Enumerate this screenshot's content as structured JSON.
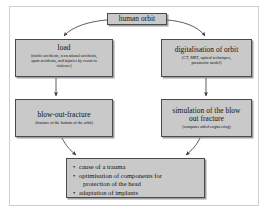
{
  "figure": {
    "type": "flowchart",
    "orientation": "top-down",
    "box_fill": "#c9c9c9",
    "box_border": "#4a4a4a",
    "arrow_color": "#333333",
    "frame_color": "#cfcfcf"
  },
  "nodes": {
    "root": {
      "id": "human-orbit",
      "title": "human orbit",
      "subtitle": ""
    },
    "load": {
      "id": "load",
      "title": "load",
      "subtitle_line1": "(traffic accidents, recreational accidents,",
      "subtitle_line2": "sport accidents, and injuries by resort to",
      "subtitle_line3": "violence)"
    },
    "digitalisation": {
      "id": "digitalisation-of-orbit",
      "title": "digitalisation of orbit",
      "subtitle_line1": "(CT, MRT, optical techniques,",
      "subtitle_line2": "parametric model)"
    },
    "blowout": {
      "id": "blow-out-fracture",
      "title": "blow-out-fracture",
      "subtitle_line1": "(fracture of the bottom of the orbit)"
    },
    "simulation": {
      "id": "simulation-of-the-blow-out-fracture",
      "title_line1": "simulation of the blow",
      "title_line2": "out fracture",
      "subtitle_line1": "(computer aided engineering)"
    },
    "results": {
      "id": "results",
      "bullet_char": "•",
      "items": [
        {
          "line1": "cause of a trauma",
          "line2": ""
        },
        {
          "line1": "optimisation of components for",
          "line2": "protection of the head"
        },
        {
          "line1": "adaptation of implants",
          "line2": ""
        }
      ]
    }
  },
  "edges": [
    {
      "from": "human orbit",
      "to": "load",
      "style": "curved-arrow"
    },
    {
      "from": "human orbit",
      "to": "digitalisation of orbit",
      "style": "curved-arrow"
    },
    {
      "from": "load",
      "to": "blow-out-fracture",
      "style": "straight-arrow"
    },
    {
      "from": "digitalisation of orbit",
      "to": "simulation of the blow out fracture",
      "style": "straight-arrow"
    },
    {
      "from": "blow-out-fracture",
      "to": "results",
      "style": "curved-arrow"
    },
    {
      "from": "simulation of the blow out fracture",
      "to": "results",
      "style": "curved-arrow"
    }
  ]
}
